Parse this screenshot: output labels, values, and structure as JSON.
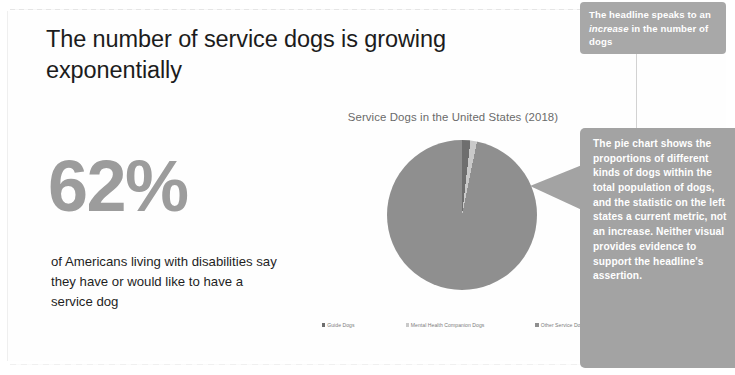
{
  "slide": {
    "headline": "The number of service dogs is growing exponentially",
    "statistic": {
      "value": "62%",
      "description": "of Americans living with disabilities say they have or would like to have a service dog"
    }
  },
  "chart_data": {
    "type": "pie",
    "title": "Service Dogs in the United States (2018)",
    "categories": [
      "Guide Dogs",
      "Mental Health Companion Dogs",
      "Other Service Dogs"
    ],
    "values": [
      1.8,
      1.4,
      96.8
    ],
    "colors": [
      "#6e6e6e",
      "#c9c9c9",
      "#8f8f8f"
    ],
    "legend_position": "bottom",
    "labels_shown": false,
    "grid": false,
    "xlabel": "",
    "ylabel": ""
  },
  "annotations": {
    "top": {
      "before": "The headline speaks to an ",
      "emphasis": "increase",
      "after": " in the number of dogs"
    },
    "main": "The pie chart shows the proportions of different kinds of dogs within the total population of dogs, and the statistic on the left states a current metric, not an increase. Neither visual provides evidence to support the headline's assertion."
  },
  "theme": {
    "callout_color": "#a3a3a3",
    "stat_color": "#9c9c9c",
    "text_color": "#1c1c1c"
  }
}
